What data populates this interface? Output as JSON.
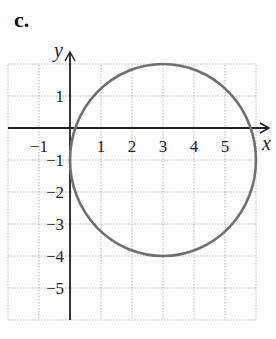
{
  "panel_label": "c.",
  "chart_data": {
    "type": "line",
    "title": "",
    "xlabel": "x",
    "ylabel": "y",
    "xlim": [
      -2,
      6
    ],
    "ylim": [
      -6,
      2
    ],
    "grid": true,
    "x_tick_labels": [
      "−1",
      "1",
      "2",
      "3",
      "4",
      "5"
    ],
    "x_ticks": [
      -1,
      1,
      2,
      3,
      4,
      5
    ],
    "y_tick_labels": [
      "1",
      "−1",
      "−2",
      "−3",
      "−4",
      "−5"
    ],
    "y_ticks": [
      1,
      -1,
      -2,
      -3,
      -4,
      -5
    ],
    "series": [
      {
        "name": "circle",
        "shape": "circle",
        "center": [
          3,
          -1
        ],
        "radius": 3,
        "equation": "(x-3)^2 + (y+1)^2 = 9",
        "color": "#707070"
      }
    ],
    "legend": null
  }
}
